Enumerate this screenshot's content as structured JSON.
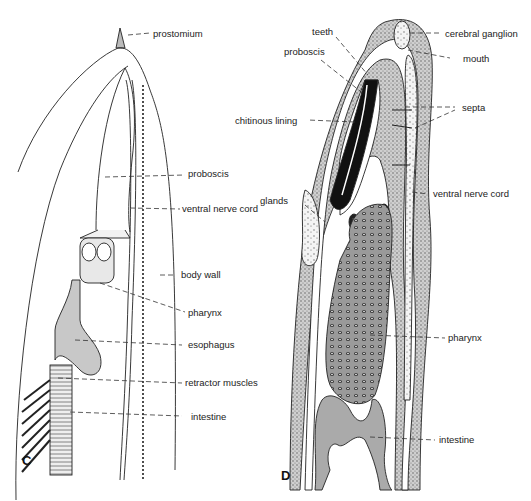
{
  "figure": {
    "panels": [
      {
        "id": "C",
        "letter": "C",
        "labels": {
          "prostomium": "prostomium",
          "proboscis": "proboscis",
          "ventral_nerve_cord": "ventral nerve cord",
          "body_wall": "body wall",
          "pharynx": "pharynx",
          "esophagus": "esophagus",
          "retractor_muscles": "retractor muscles",
          "intestine": "intestine"
        }
      },
      {
        "id": "D",
        "letter": "D",
        "labels": {
          "teeth": "teeth",
          "proboscis": "proboscis",
          "chitinous_lining": "chitinous lining",
          "glands": "glands",
          "cerebral_ganglion": "cerebral ganglion",
          "mouth": "mouth",
          "septa": "septa",
          "ventral_nerve_cord": "ventral nerve cord",
          "pharynx": "pharynx",
          "intestine": "intestine"
        }
      }
    ]
  }
}
